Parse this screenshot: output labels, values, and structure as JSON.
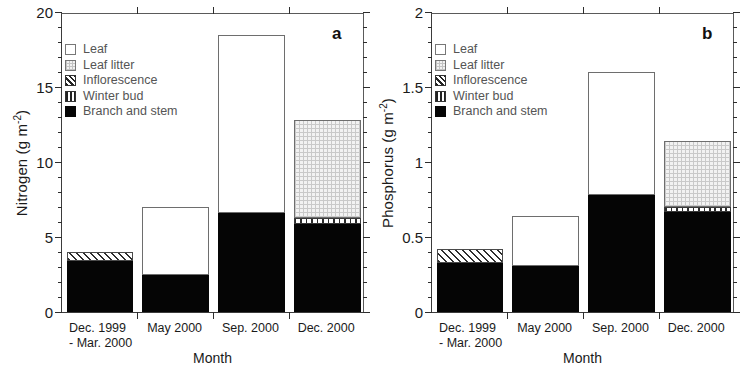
{
  "figure": {
    "width": 739,
    "height": 376,
    "background": "#ffffff"
  },
  "legend": {
    "items": [
      {
        "label": "Leaf",
        "key": "leaf",
        "swatch": "white-square-icon",
        "color": "#ffffff"
      },
      {
        "label": "Leaf litter",
        "key": "litter",
        "swatch": "light-grid-square-icon",
        "color": "#f2f2f2"
      },
      {
        "label": "Inflorescence",
        "key": "inflorescence",
        "swatch": "diagonal-hatch-square-icon",
        "color": "#2e2e2e"
      },
      {
        "label": "Winter bud",
        "key": "winterbud",
        "swatch": "vertical-lines-square-icon",
        "color": "#2b2b2b"
      },
      {
        "label": "Branch and stem",
        "key": "branch",
        "swatch": "black-square-icon",
        "color": "#050505"
      }
    ]
  },
  "chart_data": [
    {
      "panel": "a",
      "panel_letter": "a",
      "type": "bar",
      "stacked": true,
      "title": "",
      "xlabel": "Month",
      "ylabel": "Nitrogen (g m-2)",
      "ylabel_main": "Nitrogen (g m",
      "ylabel_sup": "-2",
      "ylabel_tail": ")",
      "categories": [
        "Dec. 1999 - Mar. 2000",
        "May 2000",
        "Sep. 2000",
        "Dec. 2000"
      ],
      "category_lines": [
        [
          "Dec. 1999",
          "- Mar. 2000"
        ],
        [
          "May 2000"
        ],
        [
          "Sep. 2000"
        ],
        [
          "Dec. 2000"
        ]
      ],
      "ylim": [
        0,
        20
      ],
      "yticks": [
        0,
        5,
        10,
        15,
        20
      ],
      "ytick_labels": [
        "0",
        "5",
        "10",
        "15",
        "20"
      ],
      "yminor_step": 1,
      "grid": false,
      "legend_position": "upper-left",
      "series": [
        {
          "name": "Branch and stem",
          "key": "branch",
          "values": [
            3.4,
            2.5,
            6.6,
            5.9
          ]
        },
        {
          "name": "Winter bud",
          "key": "winterbud",
          "values": [
            0,
            0,
            0,
            0.35
          ]
        },
        {
          "name": "Inflorescence",
          "key": "inflorescence",
          "values": [
            0.6,
            0,
            0,
            0
          ]
        },
        {
          "name": "Leaf litter",
          "key": "litter",
          "values": [
            0,
            0,
            0,
            6.55
          ]
        },
        {
          "name": "Leaf",
          "key": "leaf",
          "values": [
            0,
            4.5,
            11.9,
            0
          ]
        }
      ],
      "totals": [
        4.0,
        7.0,
        18.5,
        12.8
      ]
    },
    {
      "panel": "b",
      "panel_letter": "b",
      "type": "bar",
      "stacked": true,
      "title": "",
      "xlabel": "Month",
      "ylabel": "Phosphorus (g m-2)",
      "ylabel_main": "Phosphorus (g m",
      "ylabel_sup": "-2",
      "ylabel_tail": ")",
      "categories": [
        "Dec. 1999 - Mar. 2000",
        "May 2000",
        "Sep. 2000",
        "Dec. 2000"
      ],
      "category_lines": [
        [
          "Dec. 1999",
          "- Mar. 2000"
        ],
        [
          "May 2000"
        ],
        [
          "Sep. 2000"
        ],
        [
          "Dec. 2000"
        ]
      ],
      "ylim": [
        0,
        2
      ],
      "yticks": [
        0,
        0.5,
        1,
        1.5,
        2
      ],
      "ytick_labels": [
        "0",
        "0.5",
        "1",
        "1.5",
        "2"
      ],
      "yminor_step": 0.1,
      "grid": false,
      "legend_position": "upper-left",
      "series": [
        {
          "name": "Branch and stem",
          "key": "branch",
          "values": [
            0.33,
            0.31,
            0.78,
            0.67
          ]
        },
        {
          "name": "Winter bud",
          "key": "winterbud",
          "values": [
            0,
            0,
            0,
            0.03
          ]
        },
        {
          "name": "Inflorescence",
          "key": "inflorescence",
          "values": [
            0.09,
            0,
            0,
            0
          ]
        },
        {
          "name": "Leaf litter",
          "key": "litter",
          "values": [
            0,
            0,
            0,
            0.44
          ]
        },
        {
          "name": "Leaf",
          "key": "leaf",
          "values": [
            0,
            0.33,
            0.82,
            0
          ]
        }
      ],
      "totals": [
        0.42,
        0.64,
        1.6,
        1.14
      ]
    }
  ]
}
